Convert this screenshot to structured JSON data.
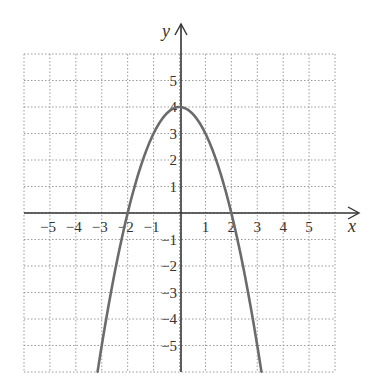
{
  "chart_data": {
    "type": "line",
    "title": "",
    "xlabel": "x",
    "ylabel": "y",
    "xlim": [
      -6,
      6
    ],
    "ylim": [
      -6,
      6
    ],
    "grid": true,
    "grid_style": "dotted",
    "x_ticks": [
      "-5",
      "-4",
      "-3",
      "-2",
      "-1",
      "1",
      "2",
      "3",
      "4",
      "5"
    ],
    "y_ticks": [
      "5",
      "4",
      "3",
      "2",
      "1",
      "-1",
      "-2",
      "-3",
      "-4",
      "-5"
    ],
    "series": [
      {
        "name": "y = 4 - x^2",
        "equation": "y = 4 - x^2",
        "color": "#6b6b6b",
        "x": [
          -3.16,
          -3,
          -2.5,
          -2,
          -1.5,
          -1,
          -0.5,
          0,
          0.5,
          1,
          1.5,
          2,
          2.5,
          3,
          3.16
        ],
        "y": [
          -6,
          -5,
          -2.25,
          0,
          1.75,
          3,
          3.75,
          4,
          3.75,
          3,
          1.75,
          0,
          -2.25,
          -5,
          -6
        ]
      }
    ],
    "key_points": {
      "vertex": [
        0,
        4
      ],
      "x_intercepts": [
        [
          -2,
          0
        ],
        [
          2,
          0
        ]
      ],
      "y_intercept": [
        0,
        4
      ]
    }
  },
  "labels": {
    "x_axis": "x",
    "y_axis": "y",
    "x_ticks": [
      {
        "text": "−5",
        "v": -5
      },
      {
        "text": "−4",
        "v": -4
      },
      {
        "text": "−3",
        "v": -3
      },
      {
        "text": "−2",
        "v": -2
      },
      {
        "text": "−1",
        "v": -1
      },
      {
        "text": "1",
        "v": 1
      },
      {
        "text": "2",
        "v": 2
      },
      {
        "text": "3",
        "v": 3
      },
      {
        "text": "4",
        "v": 4
      },
      {
        "text": "5",
        "v": 5
      }
    ],
    "y_ticks": [
      {
        "text": "5",
        "v": 5
      },
      {
        "text": "4",
        "v": 4
      },
      {
        "text": "3",
        "v": 3
      },
      {
        "text": "2",
        "v": 2
      },
      {
        "text": "1",
        "v": 1
      },
      {
        "text": "−1",
        "v": -1
      },
      {
        "text": "−2",
        "v": -2
      },
      {
        "text": "−3",
        "v": -3
      },
      {
        "text": "−4",
        "v": -4
      },
      {
        "text": "−5",
        "v": -5
      }
    ]
  },
  "colors": {
    "grid": "#9a9a9a",
    "axis": "#333333",
    "curve": "#6b6b6b"
  }
}
